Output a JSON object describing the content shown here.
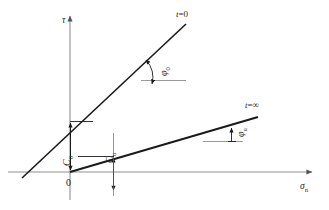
{
  "figure": {
    "background_color": "#ffffff",
    "line_color": "#1a1a1a",
    "axis_color": "#8a8a8a",
    "text_color": "#2a2a2a"
  },
  "axes": {
    "y_axis_label": "τ",
    "x_axis_label": "σ",
    "x_axis_label_sub": "n",
    "origin_label": "0",
    "x_axis_y_px": 172,
    "y_axis_x_px": 70
  },
  "curves": [
    {
      "id": "t0",
      "label": "t",
      "label_eq": "=",
      "label_value": "0",
      "label_full": "t=0",
      "description": "steep total-stress failure envelope at time zero",
      "x_intercept_px": 31,
      "end_px": [
        185,
        25
      ],
      "cohesion_intercept_px": [
        70,
        121
      ],
      "angle_label": "φ",
      "angle_sub": "0",
      "cohesion_label": "C",
      "cohesion_sub": "0"
    },
    {
      "id": "tinf",
      "label": "t",
      "label_eq": "=",
      "label_value": "∞",
      "label_full": "t=∞",
      "description": "shallow effective-stress failure envelope at time infinity",
      "x_intercept_px": 70,
      "end_px": [
        256,
        118
      ],
      "cohesion_intercept_px": [
        113,
        156
      ],
      "angle_label": "φ",
      "angle_sub": "u",
      "cohesion_label": "C",
      "cohesion_sub": "u"
    }
  ],
  "annotations": {
    "cohesion_0": {
      "symbol": "C",
      "subscript": "0",
      "name": "C0-cohesion-dimension"
    },
    "cohesion_u": {
      "symbol": "C",
      "subscript": "u",
      "name": "Cu-cohesion-dimension"
    },
    "phi_0": {
      "symbol": "φ",
      "subscript": "0",
      "name": "phi0-friction-angle"
    },
    "phi_u": {
      "symbol": "φ",
      "subscript": "u",
      "name": "phiu-friction-angle"
    }
  }
}
